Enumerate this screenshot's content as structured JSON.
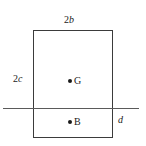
{
  "figure": {
    "type": "engineering-cross-section-diagram",
    "background_color": "#ffffff",
    "line_color": "#3b3b3b",
    "reference_line_color": "#5a5a5a",
    "marker_color": "#1a1a1a"
  },
  "dimensions": {
    "top_width": {
      "coefficient": "2",
      "variable": "b",
      "full": "2b"
    },
    "left_height": {
      "coefficient": "2",
      "variable": "c",
      "full": "2c"
    },
    "draft": {
      "coefficient": "",
      "variable": "d",
      "full": "d"
    }
  },
  "points": [
    {
      "id": "G",
      "label": "G",
      "marker": "filled-dot"
    },
    {
      "id": "B",
      "label": "B",
      "marker": "filled-dot"
    }
  ],
  "elements": {
    "rectangle_name": "section-rectangle",
    "reference_line_name": "reference-line"
  }
}
